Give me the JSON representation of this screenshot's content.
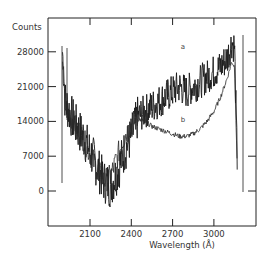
{
  "chart_data": {
    "type": "line",
    "title": "",
    "xlabel": "Wavelength (Å)",
    "ylabel": "Counts",
    "xlim": [
      1800,
      3300
    ],
    "ylim": [
      -7000,
      35000
    ],
    "xticks": [
      2100,
      2400,
      2700,
      3000
    ],
    "xtick_labels": [
      "2100",
      "2400",
      "2700",
      "3000"
    ],
    "yticks": [
      0,
      7000,
      14000,
      21000,
      28000
    ],
    "ytick_labels": [
      "0",
      "7000",
      "14000",
      "21000",
      "28000"
    ],
    "grid": false,
    "legend": null,
    "annotations": [
      {
        "text": "a",
        "x": 2760,
        "y": 28500
      },
      {
        "text": "b",
        "x": 2760,
        "y": 13800
      }
    ],
    "series": [
      {
        "name": "a",
        "style": "noisy spectrum",
        "x": [
          1900,
          1920,
          1950,
          2000,
          2050,
          2100,
          2150,
          2200,
          2250,
          2300,
          2350,
          2400,
          2450,
          2500,
          2550,
          2600,
          2650,
          2700,
          2750,
          2800,
          2850,
          2900,
          2950,
          3000,
          3050,
          3100,
          3130,
          3150,
          3170
        ],
        "y": [
          28000,
          18000,
          16000,
          13000,
          11000,
          8000,
          5000,
          2000,
          1000,
          4000,
          8000,
          11000,
          15000,
          16000,
          17000,
          18000,
          19000,
          20000,
          21000,
          20000,
          21000,
          22000,
          23000,
          24000,
          25000,
          27000,
          30000,
          29000,
          5000
        ]
      },
      {
        "name": "b",
        "style": "smooth spectrum",
        "x": [
          1900,
          1920,
          1950,
          2000,
          2050,
          2100,
          2150,
          2200,
          2250,
          2300,
          2350,
          2400,
          2450,
          2500,
          2550,
          2600,
          2650,
          2700,
          2750,
          2800,
          2850,
          2900,
          2950,
          3000,
          3050,
          3100,
          3130,
          3150,
          3170
        ],
        "y": [
          27000,
          17000,
          15500,
          13000,
          10500,
          7500,
          4500,
          2000,
          3000,
          7000,
          11000,
          13500,
          14500,
          14000,
          13000,
          12500,
          12000,
          11500,
          11000,
          11000,
          11500,
          12500,
          14000,
          16000,
          19000,
          23000,
          26000,
          25000,
          4000
        ]
      }
    ]
  }
}
